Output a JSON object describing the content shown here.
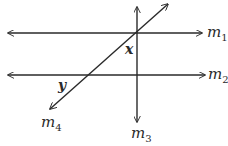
{
  "diagram": {
    "type": "parallel-lines-transversal",
    "stroke_color": "#2a2a2a",
    "background": "#ffffff",
    "lines": [
      {
        "id": "m1",
        "name": "m",
        "subscript": "1",
        "orientation": "horizontal",
        "arrows": "both"
      },
      {
        "id": "m2",
        "name": "m",
        "subscript": "2",
        "orientation": "horizontal",
        "arrows": "both"
      },
      {
        "id": "m3",
        "name": "m",
        "subscript": "3",
        "orientation": "vertical",
        "arrows": "both"
      },
      {
        "id": "m4",
        "name": "m",
        "subscript": "4",
        "orientation": "diagonal",
        "arrows": "both"
      }
    ],
    "angles": [
      {
        "label": "x",
        "location": "between m4 and m3 below m1 at their intersection"
      },
      {
        "label": "y",
        "location": "below m2, left of m4 at their intersection"
      }
    ]
  }
}
